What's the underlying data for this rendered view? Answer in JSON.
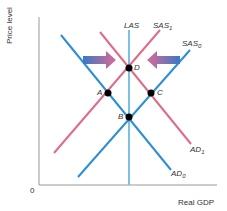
{
  "diagram": {
    "type": "AS-AD macroeconomic diagram",
    "axes": {
      "y_label": "Price level",
      "x_label": "Real GDP",
      "origin_label": "0"
    },
    "curves": [
      {
        "id": "LAS",
        "label": "LAS",
        "color": "#7cc0e8",
        "kind": "vertical"
      },
      {
        "id": "SAS1",
        "label": "SAS",
        "subscript": "1",
        "color": "#e06a88",
        "kind": "upward"
      },
      {
        "id": "SAS0",
        "label": "SAS",
        "subscript": "0",
        "color": "#2a8fd6",
        "kind": "upward"
      },
      {
        "id": "AD1",
        "label": "AD",
        "subscript": "1",
        "color": "#e06a88",
        "kind": "downward"
      },
      {
        "id": "AD0",
        "label": "AD",
        "subscript": "0",
        "color": "#2a8fd6",
        "kind": "downward"
      }
    ],
    "points": [
      {
        "label": "D",
        "desc": "intersection of AD1, SAS1 and LAS"
      },
      {
        "label": "A",
        "desc": "intersection of AD0 and SAS1"
      },
      {
        "label": "C",
        "desc": "intersection of AD1 and SAS0"
      },
      {
        "label": "B",
        "desc": "intersection of AD0, SAS0 and LAS"
      }
    ],
    "arrows": [
      {
        "direction": "right",
        "desc": "arrow pointing toward D from left"
      },
      {
        "direction": "left",
        "desc": "arrow pointing toward D from right"
      }
    ],
    "colors": {
      "blue": "#2a8fd6",
      "pink": "#e06a88",
      "las": "#7cc0e8",
      "axis": "#999999",
      "point": "#000000"
    }
  }
}
